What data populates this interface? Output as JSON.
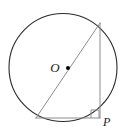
{
  "figure": {
    "kind": "geometry-diagram",
    "width": 130,
    "height": 136,
    "background_color": "#ffffff"
  },
  "labels": {
    "center_label": "O",
    "vertex_label": "P"
  },
  "colors": {
    "circle_stroke": "#2b2b2b",
    "triangle_stroke": "#8c8c8c",
    "right_angle_stroke": "#8c8c8c",
    "center_dot_fill": "#000000",
    "label_color": "#1a1a1a"
  },
  "geometry": {
    "circle": {
      "cx": 63,
      "cy": 67.5,
      "r": 54,
      "stroke_width": 1.1
    },
    "center_dot": {
      "cx": 68,
      "cy": 68,
      "r": 2.0
    },
    "triangle": {
      "vertex_bottom_left": {
        "x": 36,
        "y": 118
      },
      "vertex_top_right": {
        "x": 100,
        "y": 23
      },
      "vertex_right_angle": {
        "x": 100,
        "y": 118
      },
      "stroke_width": 1.0
    },
    "right_angle_marker": {
      "x": 91,
      "y": 110,
      "size": 8,
      "stroke_width": 1.0
    },
    "center_label_position": {
      "x": 55,
      "y": 72
    },
    "vertex_label_position": {
      "x": 103,
      "y": 126
    }
  }
}
